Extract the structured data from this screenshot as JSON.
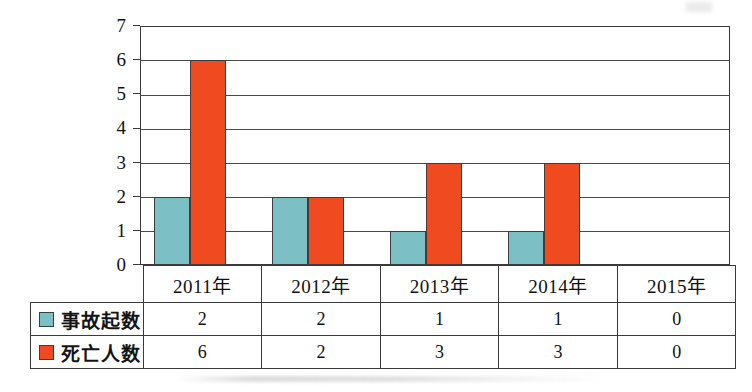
{
  "chart_data": {
    "type": "bar",
    "title": "",
    "subtitle": "",
    "xlabel": "",
    "ylabel": "",
    "categories": [
      "2011年",
      "2012年",
      "2013年",
      "2014年",
      "2015年"
    ],
    "series": [
      {
        "name": "事故起数",
        "values": [
          2,
          2,
          1,
          1,
          0
        ],
        "color": "#7cc0c6"
      },
      {
        "name": "死亡人数",
        "values": [
          6,
          2,
          3,
          3,
          0
        ],
        "color": "#f04a20"
      }
    ],
    "ylim": [
      0,
      7
    ],
    "yticks": [
      0,
      1,
      2,
      3,
      4,
      5,
      6,
      7
    ],
    "ytick_labels": [
      "0",
      "1",
      "2",
      "3",
      "4",
      "5",
      "6",
      "7"
    ],
    "grid": true,
    "grid_axis": "y",
    "legend_position": "data-table-left",
    "has_data_table": true
  },
  "axis": {
    "y_tick_labels": [
      "7",
      "6",
      "5",
      "4",
      "3",
      "2",
      "1",
      "0"
    ]
  },
  "table": {
    "header_row": [
      "",
      "2011年",
      "2012年",
      "2013年",
      "2014年",
      "2015年"
    ],
    "rows": [
      {
        "label": "事故起数",
        "swatch": "#7cc0c6",
        "cells": [
          "2",
          "2",
          "1",
          "1",
          "0"
        ]
      },
      {
        "label": "死亡人数",
        "swatch": "#f04a20",
        "cells": [
          "6",
          "2",
          "3",
          "3",
          "0"
        ]
      }
    ]
  },
  "style": {
    "accident_color": "#7cc0c6",
    "death_color": "#f04a20",
    "line_color": "#3a3a3a",
    "background": "#ffffff"
  }
}
